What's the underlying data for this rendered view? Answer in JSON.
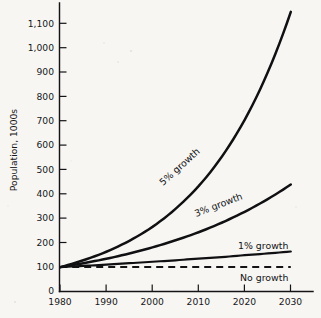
{
  "chart_data": {
    "type": "line",
    "title": "",
    "xlabel": "",
    "ylabel": "Population, 1000s",
    "xlim": [
      1980,
      2032
    ],
    "ylim": [
      0,
      1150
    ],
    "grid": false,
    "legend_position": "inline-curve-labels",
    "x_ticks": [
      "1980",
      "1990",
      "2000",
      "2010",
      "2020",
      "2030"
    ],
    "x_tick_values": [
      1980,
      1990,
      2000,
      2010,
      2020,
      2030
    ],
    "y_ticks": [
      "0",
      "100",
      "200",
      "300",
      "400",
      "500",
      "600",
      "700",
      "800",
      "900",
      "1,000",
      "1,100"
    ],
    "y_tick_values": [
      0,
      100,
      200,
      300,
      400,
      500,
      600,
      700,
      800,
      900,
      1000,
      1100
    ],
    "x": [
      1980,
      1985,
      1990,
      1995,
      2000,
      2005,
      2010,
      2015,
      2020,
      2025,
      2030
    ],
    "series": [
      {
        "name": "5% growth",
        "label": "5% growth",
        "style": "solid",
        "label_rotation": -42,
        "values": [
          100,
          128,
          163,
          208,
          265,
          339,
          432,
          552,
          704,
          899,
          1147
        ]
      },
      {
        "name": "3% growth",
        "label": "3% growth",
        "style": "solid",
        "label_rotation": -21,
        "values": [
          100,
          116,
          134,
          156,
          181,
          210,
          243,
          282,
          327,
          379,
          439
        ]
      },
      {
        "name": "1% growth",
        "label": "1% growth",
        "style": "solid",
        "label_rotation": 0,
        "values": [
          100,
          105,
          110,
          116,
          122,
          128,
          135,
          141,
          149,
          156,
          164
        ]
      },
      {
        "name": "No growth",
        "label": "No growth",
        "style": "dashed",
        "label_rotation": 0,
        "values": [
          100,
          100,
          100,
          100,
          100,
          100,
          100,
          100,
          100,
          100,
          100
        ]
      }
    ],
    "colors": {
      "line": "#101013",
      "axis": "#141417",
      "text": "#17171a",
      "background": "#f7f6f3"
    }
  }
}
